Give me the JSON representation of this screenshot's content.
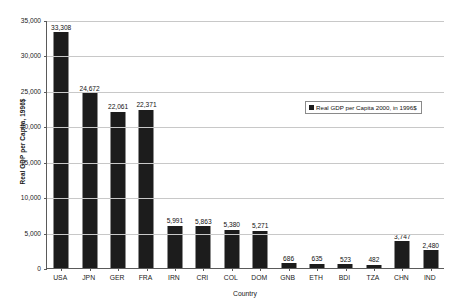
{
  "chart_data": {
    "type": "bar",
    "title": "",
    "xlabel": "Country",
    "ylabel": "Real GDP per Capita, 1996$",
    "ylim": [
      0,
      35000
    ],
    "y_ticks": [
      "0",
      "5,000",
      "10,000",
      "15,000",
      "20,000",
      "25,000",
      "30,000",
      "35,000"
    ],
    "y_tick_values": [
      0,
      5000,
      10000,
      15000,
      20000,
      25000,
      30000,
      35000
    ],
    "grid": "horizontal",
    "legend_position": "top-right-inside",
    "legend": [
      "Real GDP per Capita 2000, in 1996$"
    ],
    "categories": [
      "USA",
      "JPN",
      "GER",
      "FRA",
      "IRN",
      "CRI",
      "COL",
      "DOM",
      "GNB",
      "ETH",
      "BDI",
      "TZA",
      "CHN",
      "IND"
    ],
    "values": [
      33308,
      24672,
      22061,
      22371,
      5991,
      5863,
      5380,
      5271,
      686,
      635,
      523,
      482,
      3747,
      2480
    ],
    "data_labels": [
      "33,308",
      "24,672",
      "22,061",
      "22,371",
      "5,991",
      "5,863",
      "5,380",
      "5,271",
      "686",
      "635",
      "523",
      "482",
      "3,747",
      "2,480"
    ],
    "series": [
      {
        "name": "Real GDP per Capita 2000, in 1996$",
        "color": "#1c1c1c",
        "values": [
          33308,
          24672,
          22061,
          22371,
          5991,
          5863,
          5380,
          5271,
          686,
          635,
          523,
          482,
          3747,
          2480
        ]
      }
    ],
    "colors": {
      "bar": "#1c1c1c",
      "gridline": "#c8c8c8",
      "axis": "#5a5a5a",
      "plot_background": "#ffffff",
      "text": "#1a1a1a"
    }
  }
}
